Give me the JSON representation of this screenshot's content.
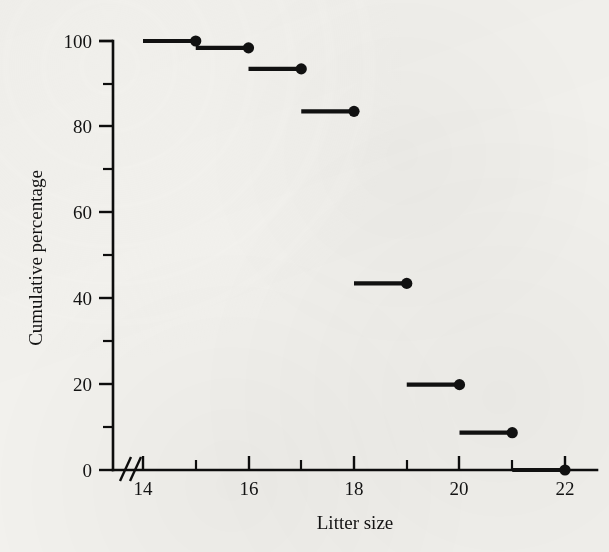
{
  "figure": {
    "background_color": "#f2f1ed",
    "ink_color": "#111111",
    "axis_break_symbol": "//"
  },
  "chart_data": {
    "type": "line",
    "subtype": "step-function",
    "title": "",
    "subtitle": "",
    "xlabel": "Litter size",
    "ylabel": "Cumulative percentage",
    "xlim": [
      13.4,
      22.6
    ],
    "ylim": [
      0,
      104
    ],
    "grid": false,
    "legend": null,
    "x_major_ticks": [
      14,
      16,
      18,
      20,
      22
    ],
    "x_minor_ticks": [
      15,
      17,
      19,
      21
    ],
    "x_tick_labels": [
      "14",
      "16",
      "18",
      "20",
      "22"
    ],
    "y_major_ticks": [
      0,
      20,
      40,
      60,
      80,
      100
    ],
    "y_minor_ticks": [
      10,
      30,
      50,
      70,
      90
    ],
    "y_tick_labels": [
      "0",
      "20",
      "40",
      "60",
      "80",
      "100"
    ],
    "axis_break_on": "x",
    "steps": [
      {
        "x_start": 14,
        "x_end": 15,
        "value": 100.0,
        "dot_at_x": 15
      },
      {
        "x_start": 15,
        "x_end": 16,
        "value": 98.4,
        "dot_at_x": 16
      },
      {
        "x_start": 16,
        "x_end": 17,
        "value": 93.5,
        "dot_at_x": 17
      },
      {
        "x_start": 17,
        "x_end": 18,
        "value": 83.6,
        "dot_at_x": 18
      },
      {
        "x_start": 18,
        "x_end": 19,
        "value": 43.5,
        "dot_at_x": 19
      },
      {
        "x_start": 19,
        "x_end": 20,
        "value": 19.9,
        "dot_at_x": 20
      },
      {
        "x_start": 20,
        "x_end": 21,
        "value": 8.7,
        "dot_at_x": 21
      },
      {
        "x_start": 21,
        "x_end": 22,
        "value": 0.0,
        "dot_at_x": 22
      }
    ],
    "x": [
      15,
      16,
      17,
      18,
      19,
      20,
      21,
      22
    ],
    "values": [
      100.0,
      98.4,
      93.5,
      83.6,
      43.5,
      19.9,
      8.7,
      0.0
    ]
  }
}
